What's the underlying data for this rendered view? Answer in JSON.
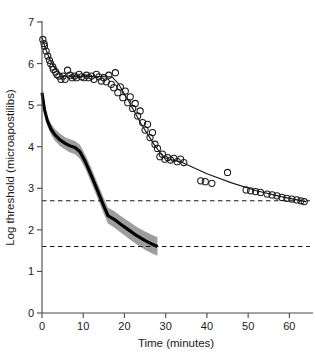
{
  "chart_data": {
    "type": "scatter",
    "title": "",
    "xlabel": "Time (minutes)",
    "ylabel": "Log threshold (microapostilibs)",
    "xlim": [
      0,
      65
    ],
    "ylim": [
      0,
      7
    ],
    "xticks": [
      0,
      10,
      20,
      30,
      40,
      50,
      60
    ],
    "yticks": [
      0,
      1,
      2,
      3,
      4,
      5,
      6,
      7
    ],
    "xticklabels": [
      "0",
      "10",
      "20",
      "30",
      "40",
      "50",
      "60"
    ],
    "yticklabels": [
      "0",
      "1",
      "2",
      "3",
      "4",
      "5",
      "6",
      "7"
    ],
    "grid": false,
    "legend": null,
    "series": [
      {
        "name": "Measured thresholds",
        "type": "scatter",
        "marker": "open-circle",
        "color": "#1a1a1a",
        "points": [
          [
            0.2,
            6.58
          ],
          [
            0.5,
            6.48
          ],
          [
            0.6,
            6.42
          ],
          [
            1.0,
            6.3
          ],
          [
            1.4,
            6.18
          ],
          [
            1.8,
            6.08
          ],
          [
            2.1,
            6.0
          ],
          [
            2.6,
            5.92
          ],
          [
            2.8,
            5.86
          ],
          [
            3.3,
            5.8
          ],
          [
            3.6,
            5.74
          ],
          [
            4.1,
            5.7
          ],
          [
            4.6,
            5.62
          ],
          [
            5.1,
            5.7
          ],
          [
            5.6,
            5.62
          ],
          [
            6.2,
            5.84
          ],
          [
            6.8,
            5.72
          ],
          [
            7.3,
            5.66
          ],
          [
            7.9,
            5.7
          ],
          [
            8.4,
            5.66
          ],
          [
            9.0,
            5.74
          ],
          [
            9.6,
            5.68
          ],
          [
            10.2,
            5.66
          ],
          [
            10.8,
            5.72
          ],
          [
            11.4,
            5.66
          ],
          [
            12.0,
            5.7
          ],
          [
            12.6,
            5.62
          ],
          [
            13.2,
            5.74
          ],
          [
            13.8,
            5.68
          ],
          [
            14.4,
            5.58
          ],
          [
            15.0,
            5.66
          ],
          [
            15.6,
            5.56
          ],
          [
            16.2,
            5.72
          ],
          [
            16.8,
            5.5
          ],
          [
            17.4,
            5.42
          ],
          [
            17.8,
            5.78
          ],
          [
            18.4,
            5.3
          ],
          [
            19.0,
            5.44
          ],
          [
            19.6,
            5.18
          ],
          [
            20.2,
            5.34
          ],
          [
            20.8,
            5.06
          ],
          [
            21.4,
            5.2
          ],
          [
            22.0,
            4.92
          ],
          [
            22.6,
            5.04
          ],
          [
            23.2,
            4.74
          ],
          [
            23.8,
            4.86
          ],
          [
            24.4,
            4.58
          ],
          [
            25.0,
            4.4
          ],
          [
            25.6,
            4.54
          ],
          [
            26.2,
            4.22
          ],
          [
            26.8,
            4.34
          ],
          [
            27.4,
            4.06
          ],
          [
            28.0,
            3.96
          ],
          [
            28.6,
            3.76
          ],
          [
            29.2,
            3.82
          ],
          [
            29.8,
            3.7
          ],
          [
            30.5,
            3.74
          ],
          [
            31.2,
            3.68
          ],
          [
            32.0,
            3.72
          ],
          [
            32.8,
            3.64
          ],
          [
            33.6,
            3.7
          ],
          [
            34.4,
            3.62
          ],
          [
            38.5,
            3.18
          ],
          [
            39.6,
            3.16
          ],
          [
            41.2,
            3.12
          ],
          [
            45.0,
            3.38
          ],
          [
            49.5,
            2.96
          ],
          [
            50.6,
            2.94
          ],
          [
            51.8,
            2.92
          ],
          [
            53.0,
            2.9
          ],
          [
            54.6,
            2.86
          ],
          [
            55.8,
            2.84
          ],
          [
            57.0,
            2.82
          ],
          [
            58.2,
            2.78
          ],
          [
            59.4,
            2.76
          ],
          [
            60.6,
            2.74
          ],
          [
            61.8,
            2.72
          ],
          [
            62.8,
            2.7
          ],
          [
            63.6,
            2.68
          ]
        ]
      },
      {
        "name": "Fitted piecewise curve",
        "type": "line",
        "color": "#1a1a1a",
        "points": [
          [
            0.0,
            6.62
          ],
          [
            1.0,
            6.32
          ],
          [
            2.0,
            6.08
          ],
          [
            3.0,
            5.9
          ],
          [
            4.0,
            5.78
          ],
          [
            5.0,
            5.72
          ],
          [
            7.0,
            5.69
          ],
          [
            10.0,
            5.69
          ],
          [
            14.0,
            5.69
          ],
          [
            17.0,
            5.68
          ],
          [
            18.5,
            5.52
          ],
          [
            21.0,
            5.1
          ],
          [
            24.0,
            4.56
          ],
          [
            27.0,
            4.08
          ],
          [
            29.5,
            3.74
          ],
          [
            31.0,
            3.7
          ],
          [
            34.0,
            3.62
          ],
          [
            40.0,
            3.35
          ],
          [
            46.0,
            3.13
          ],
          [
            52.0,
            2.94
          ],
          [
            58.0,
            2.8
          ],
          [
            64.0,
            2.68
          ]
        ]
      },
      {
        "name": "Model prediction",
        "type": "line",
        "style": "thick-with-confidence-band",
        "color": "#000000",
        "band_color": "#8c8c8c",
        "points": [
          [
            0.0,
            5.3
          ],
          [
            0.6,
            4.9
          ],
          [
            1.3,
            4.62
          ],
          [
            2.2,
            4.42
          ],
          [
            3.2,
            4.28
          ],
          [
            4.4,
            4.16
          ],
          [
            5.6,
            4.08
          ],
          [
            6.8,
            4.02
          ],
          [
            8.0,
            3.98
          ],
          [
            9.2,
            3.88
          ],
          [
            10.6,
            3.62
          ],
          [
            12.0,
            3.3
          ],
          [
            13.4,
            2.96
          ],
          [
            14.8,
            2.62
          ],
          [
            16.0,
            2.34
          ],
          [
            17.4,
            2.26
          ],
          [
            19.0,
            2.14
          ],
          [
            21.0,
            2.0
          ],
          [
            23.0,
            1.86
          ],
          [
            25.0,
            1.74
          ],
          [
            26.6,
            1.66
          ],
          [
            28.0,
            1.6
          ]
        ],
        "band_half_width": [
          0.1,
          0.11,
          0.12,
          0.13,
          0.14,
          0.15,
          0.15,
          0.16,
          0.16,
          0.17,
          0.17,
          0.18,
          0.18,
          0.19,
          0.19,
          0.2,
          0.2,
          0.21,
          0.21,
          0.22,
          0.22,
          0.22
        ]
      }
    ],
    "reference_lines": [
      {
        "name": "upper-reference",
        "orientation": "horizontal",
        "y": 2.7,
        "style": "dashed"
      },
      {
        "name": "lower-reference",
        "orientation": "horizontal",
        "y": 1.6,
        "style": "dashed"
      }
    ]
  }
}
